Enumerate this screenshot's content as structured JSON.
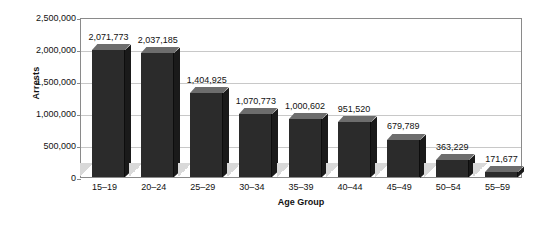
{
  "chart_data": {
    "type": "bar",
    "title": "",
    "xlabel": "Age Group",
    "ylabel": "Arrests",
    "categories": [
      "15–19",
      "20–24",
      "25–29",
      "30–34",
      "35–39",
      "40–44",
      "45–49",
      "50–54",
      "55–59"
    ],
    "values": [
      2071773,
      2037185,
      1404925,
      1070773,
      1000602,
      951520,
      679789,
      363229,
      171677
    ],
    "value_labels": [
      "2,071,773",
      "2,037,185",
      "1,404,925",
      "1,070,773",
      "1,000,602",
      "951,520",
      "679,789",
      "363,229",
      "171,677"
    ],
    "ylim": [
      0,
      2500000
    ],
    "ytick_labels": [
      "2,500,000",
      "2,000,000",
      "1,500,000",
      "1,000,000",
      "500,000",
      "0"
    ],
    "ytick_values": [
      2500000,
      2000000,
      1500000,
      1000000,
      500000,
      0
    ],
    "grid": true,
    "legend": "none",
    "colors": {
      "bar_front": "#2b2b2b",
      "bar_top": "#6d6d6d",
      "bar_side": "#1a1a1a",
      "shadow": "#d9d9d9",
      "gridline": "#c8c8c8",
      "frame": "#8a8a8a",
      "text": "#111111",
      "background": "#ffffff"
    }
  }
}
